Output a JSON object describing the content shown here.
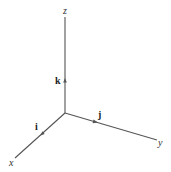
{
  "diagram": {
    "type": "3d-coordinate-axes",
    "origin": [
      65,
      113
    ],
    "axes": [
      {
        "name": "z",
        "label": "z",
        "end": [
          65,
          17
        ],
        "label_pos": [
          63,
          14
        ]
      },
      {
        "name": "y",
        "label": "y",
        "end": [
          157,
          140
        ],
        "label_pos": [
          158,
          146
        ]
      },
      {
        "name": "x",
        "label": "x",
        "end": [
          15,
          158
        ],
        "label_pos": [
          9,
          166
        ]
      }
    ],
    "unit_vectors": [
      {
        "name": "k",
        "label": "k",
        "axis": "z",
        "tip": [
          65,
          80
        ],
        "label_pos": [
          55,
          84
        ]
      },
      {
        "name": "j",
        "label": "j",
        "axis": "y",
        "tip": [
          96,
          122
        ],
        "label_pos": [
          98,
          118
        ]
      },
      {
        "name": "i",
        "label": "i",
        "axis": "x",
        "tip": [
          42,
          134
        ],
        "label_pos": [
          35,
          130
        ]
      }
    ],
    "colors": {
      "axis": "#555555",
      "text": "#333333"
    }
  }
}
